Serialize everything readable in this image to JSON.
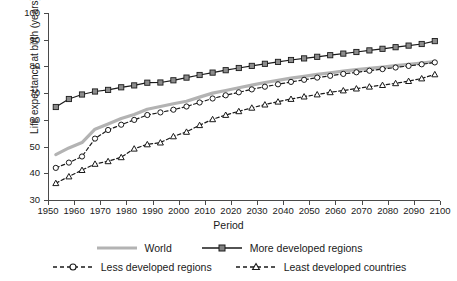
{
  "chart_data": {
    "type": "line",
    "title": "",
    "xlabel": "Period",
    "ylabel": "Life expectancy at birth (years)",
    "xlim": [
      1950,
      2100
    ],
    "ylim": [
      30,
      100
    ],
    "xticks": [
      "1950",
      "1960",
      "1970",
      "1980",
      "1990",
      "2000",
      "2010",
      "2020",
      "2030",
      "2040",
      "2050",
      "2060",
      "2070",
      "2080",
      "2090",
      "2100"
    ],
    "yticks": [
      "30",
      "40",
      "50",
      "60",
      "70",
      "80",
      "90",
      "100"
    ],
    "grid": false,
    "legend_position": "bottom",
    "x": [
      1953,
      1958,
      1963,
      1968,
      1973,
      1978,
      1983,
      1988,
      1993,
      1998,
      2003,
      2008,
      2013,
      2018,
      2023,
      2028,
      2033,
      2038,
      2043,
      2048,
      2053,
      2058,
      2063,
      2068,
      2073,
      2078,
      2083,
      2088,
      2093,
      2098
    ],
    "series": [
      {
        "name": "World",
        "color": "#b3b3b3",
        "marker": "none",
        "dash": "solid",
        "values": [
          47.0,
          49.5,
          51.5,
          56.5,
          58.5,
          60.5,
          62.0,
          64.0,
          65.0,
          66.0,
          67.0,
          68.5,
          70.0,
          71.0,
          72.0,
          73.0,
          74.0,
          74.8,
          75.6,
          76.3,
          77.0,
          77.6,
          78.2,
          78.8,
          79.3,
          79.8,
          80.3,
          80.8,
          81.3,
          81.8
        ]
      },
      {
        "name": "More developed regions",
        "color": "#1a1a1a",
        "marker": "square",
        "dash": "solid",
        "values": [
          64.8,
          67.8,
          69.5,
          70.6,
          71.2,
          72.2,
          72.9,
          73.9,
          74.0,
          74.8,
          75.8,
          76.8,
          77.7,
          78.6,
          79.4,
          80.2,
          81.0,
          81.7,
          82.4,
          83.0,
          83.6,
          84.2,
          84.8,
          85.4,
          86.0,
          86.6,
          87.2,
          87.8,
          88.4,
          89.5
        ]
      },
      {
        "name": "Less developed regions",
        "color": "#1a1a1a",
        "marker": "circle",
        "dash": "dashed",
        "values": [
          42.0,
          44.0,
          46.3,
          53.0,
          56.2,
          58.2,
          60.0,
          61.8,
          62.8,
          63.8,
          65.0,
          66.5,
          68.0,
          69.2,
          70.3,
          71.4,
          72.4,
          73.3,
          74.2,
          75.0,
          75.8,
          76.5,
          77.2,
          77.8,
          78.4,
          79.0,
          79.6,
          80.2,
          80.8,
          81.5
        ]
      },
      {
        "name": "Least developed countries",
        "color": "#1a1a1a",
        "marker": "triangle",
        "dash": "dashed",
        "values": [
          36.3,
          38.8,
          41.2,
          43.5,
          44.5,
          46.0,
          49.2,
          50.8,
          51.5,
          53.8,
          55.5,
          58.0,
          60.2,
          61.8,
          63.2,
          64.5,
          65.7,
          66.8,
          67.8,
          68.7,
          69.5,
          70.3,
          71.0,
          71.7,
          72.4,
          73.0,
          73.7,
          74.5,
          75.5,
          77.0
        ]
      }
    ]
  },
  "legend": {
    "items": [
      {
        "label": "World"
      },
      {
        "label": "More developed regions"
      },
      {
        "label": "Less developed regions"
      },
      {
        "label": "Least developed countries"
      }
    ]
  }
}
